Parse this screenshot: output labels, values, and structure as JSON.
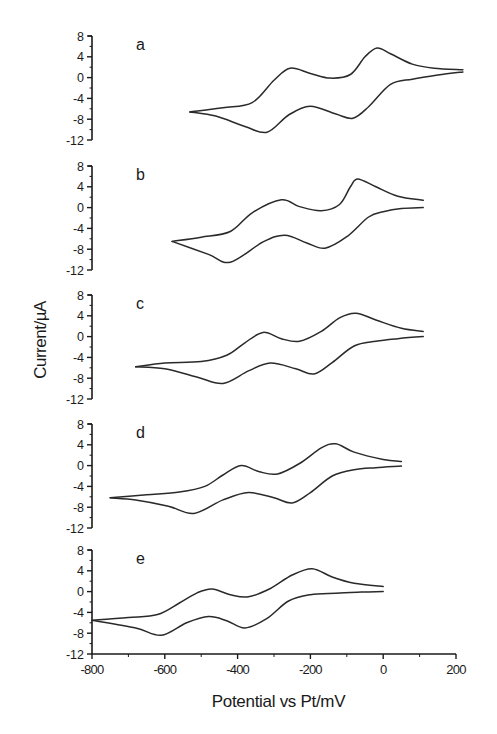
{
  "chart_data": {
    "type": "line",
    "title": "",
    "xlabel": "Potential vs Pt/mV",
    "ylabel": "Current/µA",
    "xlim": [
      -800,
      200
    ],
    "ylim": [
      -12,
      8
    ],
    "x_ticks": [
      -800,
      -600,
      -400,
      -200,
      0,
      200
    ],
    "y_ticks": [
      8,
      4,
      0,
      -4,
      -8,
      -12
    ],
    "grid": false,
    "legend": "none",
    "panels": [
      {
        "label": "a",
        "forward_scan": {
          "x": [
            -531,
            -440,
            -360,
            -300,
            -256,
            -200,
            -146,
            -90,
            -50,
            -17,
            20,
            80,
            140,
            219
          ],
          "y": [
            -6.6,
            -5.8,
            -4.8,
            -0.5,
            1.8,
            0.8,
            -0.1,
            0.6,
            4.0,
            5.7,
            4.6,
            2.6,
            1.8,
            1.5
          ]
        },
        "reverse_scan": {
          "x": [
            219,
            150,
            80,
            20,
            -40,
            -83,
            -130,
            -201,
            -260,
            -319,
            -380,
            -460,
            -531
          ],
          "y": [
            1.1,
            0.5,
            -0.3,
            -1.3,
            -5.6,
            -7.8,
            -7.0,
            -5.5,
            -7.2,
            -10.5,
            -9.4,
            -7.4,
            -6.6
          ]
        }
      },
      {
        "label": "b",
        "forward_scan": {
          "x": [
            -580,
            -500,
            -420,
            -360,
            -280,
            -230,
            -170,
            -120,
            -90,
            -70,
            -20,
            40,
            110
          ],
          "y": [
            -6.5,
            -5.7,
            -4.6,
            -1.0,
            1.5,
            0.2,
            -0.6,
            0.6,
            4.0,
            5.5,
            4.0,
            2.2,
            1.4
          ]
        },
        "reverse_scan": {
          "x": [
            110,
            50,
            0,
            -40,
            -100,
            -160,
            -210,
            -270,
            -330,
            -420,
            -480,
            -580
          ],
          "y": [
            0.0,
            -0.2,
            -0.8,
            -1.8,
            -5.6,
            -7.8,
            -6.8,
            -5.3,
            -6.6,
            -10.5,
            -9.0,
            -6.5
          ]
        }
      },
      {
        "label": "c",
        "forward_scan": {
          "x": [
            -680,
            -600,
            -500,
            -430,
            -380,
            -330,
            -280,
            -230,
            -170,
            -120,
            -75,
            -20,
            50,
            110
          ],
          "y": [
            -5.8,
            -5.1,
            -4.8,
            -3.6,
            -1.2,
            0.8,
            -0.4,
            -0.9,
            1.0,
            3.6,
            4.5,
            3.2,
            1.6,
            1.0
          ]
        },
        "reverse_scan": {
          "x": [
            110,
            40,
            -20,
            -80,
            -140,
            -190,
            -240,
            -310,
            -370,
            -440,
            -510,
            -600,
            -680
          ],
          "y": [
            0.0,
            -0.4,
            -0.9,
            -1.8,
            -5.0,
            -7.2,
            -6.2,
            -5.1,
            -6.6,
            -9.0,
            -7.8,
            -6.2,
            -5.8
          ]
        }
      },
      {
        "label": "d",
        "forward_scan": {
          "x": [
            -750,
            -650,
            -560,
            -490,
            -440,
            -390,
            -340,
            -290,
            -230,
            -170,
            -130,
            -80,
            0,
            50
          ],
          "y": [
            -6.2,
            -5.6,
            -5.1,
            -4.0,
            -1.8,
            0.0,
            -1.2,
            -1.6,
            0.4,
            3.4,
            4.2,
            2.6,
            1.2,
            0.8
          ]
        },
        "reverse_scan": {
          "x": [
            50,
            -20,
            -80,
            -140,
            -200,
            -250,
            -300,
            -370,
            -440,
            -520,
            -590,
            -680,
            -750
          ],
          "y": [
            -0.1,
            -0.4,
            -0.8,
            -2.0,
            -5.2,
            -7.2,
            -6.2,
            -5.2,
            -6.6,
            -9.2,
            -7.8,
            -6.6,
            -6.2
          ]
        }
      },
      {
        "label": "e",
        "forward_scan": {
          "x": [
            -800,
            -700,
            -620,
            -560,
            -510,
            -470,
            -420,
            -370,
            -310,
            -250,
            -195,
            -140,
            -80,
            0
          ],
          "y": [
            -5.5,
            -5.0,
            -4.4,
            -2.2,
            -0.2,
            0.5,
            -0.6,
            -1.0,
            0.6,
            3.2,
            4.4,
            2.8,
            1.6,
            1.0
          ]
        },
        "reverse_scan": {
          "x": [
            0,
            -60,
            -130,
            -200,
            -260,
            -320,
            -380,
            -430,
            -480,
            -540,
            -610,
            -680,
            -800
          ],
          "y": [
            0.0,
            -0.1,
            -0.3,
            -0.6,
            -1.8,
            -5.2,
            -7.0,
            -5.6,
            -4.8,
            -6.0,
            -8.4,
            -7.0,
            -5.5
          ]
        }
      }
    ]
  },
  "axis": {
    "xlabel": "Potential vs Pt/mV",
    "ylabel": "Current/µA"
  },
  "colors": {
    "line": "#2a2a2a",
    "axis": "#1a1a1a",
    "background": "#ffffff"
  }
}
